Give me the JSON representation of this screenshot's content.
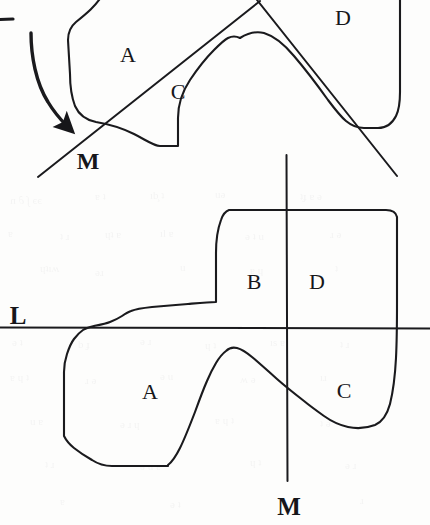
{
  "figure": {
    "caption_absent": true,
    "background_color": "#fdfdfc",
    "ink_color": "#1a1a1d",
    "width": 430,
    "height": 525,
    "panels": [
      {
        "id": "top-panel",
        "name": "rotated-figure",
        "labels": [
          {
            "id": "top-A",
            "text": "A",
            "x": 128,
            "y": 55
          },
          {
            "id": "top-C",
            "text": "C",
            "x": 178,
            "y": 92
          },
          {
            "id": "top-D",
            "text": "D",
            "x": 343,
            "y": 18
          },
          {
            "id": "top-M",
            "text": "M",
            "x": 88,
            "y": 160
          }
        ],
        "lines": [
          {
            "id": "top-line-M",
            "name": "line-M-diagonal",
            "x1": 38,
            "y1": 177,
            "x2": 260,
            "y2": 2
          },
          {
            "id": "top-line-L",
            "name": "line-L-diagonal",
            "x1": 258,
            "y1": 0,
            "x2": 397,
            "y2": 176
          }
        ],
        "arrow": {
          "id": "rotation-arrow",
          "name": "rotation-arrow",
          "from_x": 30,
          "from_y": 33,
          "to_x": 72,
          "to_y": 133
        },
        "tick": {
          "id": "top-left-tick",
          "x1": 0,
          "y1": 20,
          "x2": 13,
          "y2": 19
        }
      },
      {
        "id": "bottom-panel",
        "name": "upright-figure",
        "labels": [
          {
            "id": "bot-L",
            "text": "L",
            "x": 18,
            "y": 316
          },
          {
            "id": "bot-A",
            "text": "A",
            "x": 150,
            "y": 392
          },
          {
            "id": "bot-B",
            "text": "B",
            "x": 254,
            "y": 282
          },
          {
            "id": "bot-C",
            "text": "C",
            "x": 344,
            "y": 391
          },
          {
            "id": "bot-D",
            "text": "D",
            "x": 317,
            "y": 282
          },
          {
            "id": "bot-M",
            "text": "M",
            "x": 289,
            "y": 506
          }
        ],
        "lines": [
          {
            "id": "bot-line-L",
            "name": "line-L-horizontal",
            "x1": 0,
            "y1": 327,
            "x2": 430,
            "y2": 328
          },
          {
            "id": "bot-line-M",
            "name": "line-M-vertical",
            "x1": 286,
            "y1": 155,
            "x2": 287,
            "y2": 481
          }
        ]
      }
    ],
    "region_names": [
      "A",
      "B",
      "C",
      "D"
    ],
    "line_names": [
      "L",
      "M"
    ]
  }
}
